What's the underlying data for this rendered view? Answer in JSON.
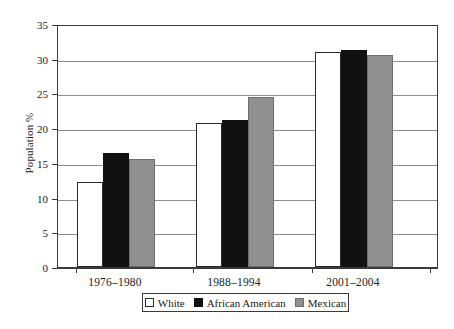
{
  "chart_data": {
    "type": "bar",
    "title": "",
    "xlabel": "",
    "ylabel": "Population %",
    "categories": [
      "1976–1980",
      "1988–1994",
      "2001–2004"
    ],
    "series": [
      {
        "name": "White",
        "color": "#ffffff",
        "values": [
          12.3,
          20.7,
          31.0
        ]
      },
      {
        "name": "African American",
        "color": "#111111",
        "values": [
          16.4,
          21.2,
          31.2
        ]
      },
      {
        "name": "Mexican",
        "color": "#909090",
        "values": [
          15.6,
          24.5,
          30.6
        ]
      }
    ],
    "ylim": [
      0,
      35
    ],
    "yticks": [
      0,
      5,
      10,
      15,
      20,
      25,
      30,
      35
    ],
    "ytick_labels": [
      "0",
      "5",
      "10",
      "15",
      "20",
      "25",
      "30",
      "35"
    ],
    "grid": true,
    "legend_position": "bottom"
  },
  "legend": {
    "items": [
      {
        "label": "White",
        "swatch": "white-swatch-icon"
      },
      {
        "label": "African American",
        "swatch": "black-swatch-icon"
      },
      {
        "label": "Mexican",
        "swatch": "gray-swatch-icon"
      }
    ]
  },
  "colors": {
    "white": "#ffffff",
    "black": "#111111",
    "gray": "#909090",
    "axis": "#3a3a3a",
    "grid": "#8d8d8d",
    "background": "#ffffff"
  }
}
